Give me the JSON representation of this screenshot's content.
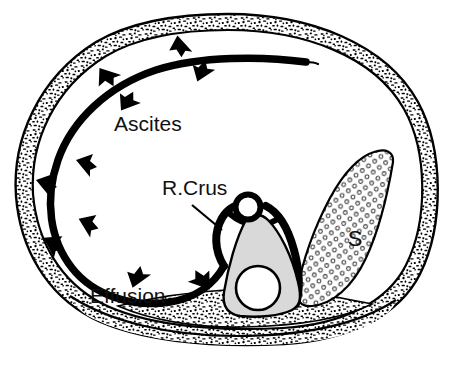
{
  "figure": {
    "kind": "medical-line-drawing",
    "background_color": "#ffffff",
    "ink_color": "#000000"
  },
  "labels": {
    "ascites": "Ascites",
    "r_crus": "R.Crus",
    "effusion": "Effusion",
    "spleen": "S"
  },
  "structures": [
    {
      "name": "body-wall",
      "label": "body wall",
      "fill": "#ffffff",
      "texture": "black-speckle"
    },
    {
      "name": "diaphragm-line",
      "label": "diaphragm / crus line",
      "fill": "#000000",
      "texture": "solid-thick-line"
    },
    {
      "name": "ascites-cavity",
      "label": "ascites (peritoneal fluid)",
      "fill": "#ffffff",
      "texture": "none"
    },
    {
      "name": "effusion-space",
      "label": "effusion (pleural fluid)",
      "fill": "#ffffff",
      "texture": "none"
    },
    {
      "name": "vertebral-body",
      "label": "vertebral body",
      "fill": "#d9d9d9",
      "texture": "flat-gray"
    },
    {
      "name": "aorta",
      "label": "aorta",
      "fill": "#ffffff",
      "texture": "outlined-circle"
    },
    {
      "name": "spinal-canal",
      "label": "spinal canal",
      "fill": "#ffffff",
      "texture": "outlined-circle"
    },
    {
      "name": "spleen",
      "label": "spleen",
      "fill": "#ffffff",
      "texture": "open-circle-stipple"
    },
    {
      "name": "posterior-muscles",
      "label": "posterior muscles",
      "fill": "#ffffff",
      "texture": "black-speckle"
    }
  ],
  "arrow_groups": [
    {
      "name": "effusion-arrows",
      "points_toward": "body-wall",
      "count": 5
    },
    {
      "name": "ascites-arrows",
      "points_toward": "peritoneal-cavity",
      "count": 5
    }
  ],
  "colors": {
    "ink": "#000000",
    "paper": "#ffffff",
    "vertebra_gray": "#d9d9d9",
    "stipple": "#333333"
  }
}
